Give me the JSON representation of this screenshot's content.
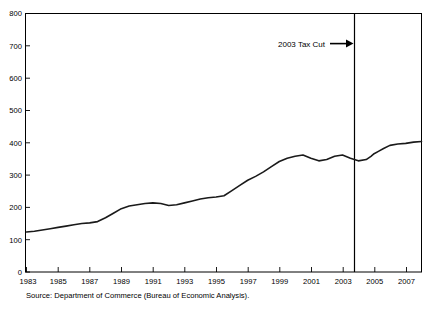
{
  "chart_data": {
    "type": "line",
    "title": "",
    "xlabel": "",
    "ylabel": "",
    "xlim": [
      1983,
      2008
    ],
    "ylim": [
      0,
      800
    ],
    "grid": false,
    "legend": "none",
    "y_ticks": [
      "0",
      "100",
      "200",
      "300",
      "400",
      "500",
      "600",
      "700",
      "800"
    ],
    "x_ticks": [
      "1983",
      "1985",
      "1987",
      "1989",
      "1991",
      "1993",
      "1995",
      "1997",
      "1999",
      "2001",
      "2003",
      "2005",
      "2007"
    ],
    "series": [
      {
        "name": "Series",
        "x": [
          1983.0,
          1983.5,
          1984.0,
          1984.5,
          1985.0,
          1985.5,
          1986.0,
          1986.5,
          1987.0,
          1987.5,
          1988.0,
          1988.5,
          1989.0,
          1989.5,
          1990.0,
          1990.5,
          1991.0,
          1991.5,
          1992.0,
          1992.5,
          1993.0,
          1993.5,
          1994.0,
          1994.5,
          1995.0,
          1995.5,
          1996.0,
          1996.5,
          1997.0,
          1997.5,
          1998.0,
          1998.5,
          1999.0,
          1999.5,
          2000.0,
          2000.5,
          2001.0,
          2001.5,
          2002.0,
          2002.5,
          2003.0,
          2003.5,
          2004.0,
          2004.5,
          2004.8,
          2005.0,
          2005.3,
          2005.6,
          2006.0,
          2006.5,
          2007.0,
          2007.5,
          2008.0
        ],
        "values": [
          124,
          126,
          130,
          134,
          138,
          142,
          146,
          150,
          152,
          156,
          168,
          182,
          196,
          204,
          208,
          212,
          214,
          212,
          206,
          208,
          214,
          220,
          226,
          230,
          232,
          236,
          252,
          268,
          284,
          296,
          310,
          326,
          342,
          352,
          358,
          362,
          352,
          344,
          348,
          358,
          362,
          352,
          344,
          348,
          358,
          366,
          374,
          382,
          392,
          396,
          398,
          402,
          404
        ],
        "marker": "none",
        "linewidth": 1.6,
        "color": "#1a1a1a"
      }
    ],
    "annotations": [
      {
        "type": "vline",
        "label": "2003 Tax Cut",
        "x": 2003,
        "arrow": "→",
        "color": "#000000"
      }
    ],
    "source": "Source: Department of Commerce (Bureau of Economic Analysis)."
  },
  "axis": {
    "y_ticks": [
      "800",
      "700",
      "600",
      "500",
      "400",
      "300",
      "200",
      "100",
      "0"
    ],
    "x_ticks": [
      "1983",
      "1985",
      "1987",
      "1989",
      "1991",
      "1993",
      "1995",
      "1997",
      "1999",
      "2001",
      "2003",
      "2005",
      "2007"
    ]
  },
  "annotation": {
    "label": "2003 Tax Cut",
    "arrow_glyph": "arrow-right-icon"
  },
  "footer": {
    "source": "Source: Department of Commerce (Bureau of Economic Analysis)."
  },
  "title": {
    "text": ""
  },
  "colors": {
    "line": "#1a1a1a",
    "axis": "#000000",
    "background": "#ffffff"
  }
}
